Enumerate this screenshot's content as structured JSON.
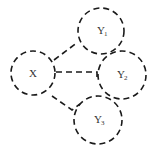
{
  "diagram": {
    "nodes": [
      {
        "id": "X",
        "label": "X",
        "subscript": ""
      },
      {
        "id": "Y1",
        "label": "Y",
        "subscript": "1"
      },
      {
        "id": "Y2",
        "label": "Y",
        "subscript": "2"
      },
      {
        "id": "Y3",
        "label": "Y",
        "subscript": "3"
      }
    ],
    "edges": [
      {
        "from": "X",
        "to": "Y1",
        "style": "dashed"
      },
      {
        "from": "X",
        "to": "Y2",
        "style": "dashed"
      },
      {
        "from": "X",
        "to": "Y3",
        "style": "dashed"
      }
    ]
  }
}
